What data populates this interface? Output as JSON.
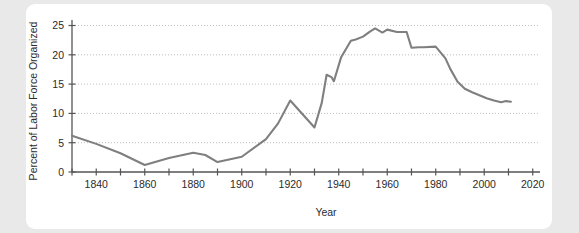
{
  "card": {
    "background_color": "#ffffff",
    "page_background_color": "#e9e9e9"
  },
  "chart_data": {
    "type": "line",
    "title": "",
    "xlabel": "Year",
    "ylabel": "Percent of Labor Force Organized",
    "xlim": [
      1830,
      2023
    ],
    "ylim": [
      0,
      25.6
    ],
    "grid": true,
    "grid_style": "dotted-horizontal",
    "legend": "none",
    "line_color": "#7f7f7f",
    "axis_color": "#555555",
    "grid_color": "#bdbdbd",
    "x_ticks_major": [
      1840,
      1860,
      1880,
      1900,
      1920,
      1940,
      1960,
      1980,
      2000,
      2020
    ],
    "x_tick_labels": [
      "1840",
      "1860",
      "1880",
      "1900",
      "1920",
      "1940",
      "1960",
      "1980",
      "2000",
      "2020"
    ],
    "x_ticks_minor": [
      1830,
      1850,
      1870,
      1890,
      1910,
      1930,
      1950,
      1970,
      1990,
      2010
    ],
    "y_ticks": [
      0,
      5,
      10,
      15,
      20,
      25
    ],
    "y_tick_labels": [
      "0",
      "5",
      "10",
      "15",
      "20",
      "25"
    ],
    "series": [
      {
        "name": "Percent of Labor Force Organized",
        "x": [
          1830,
          1840,
          1850,
          1860,
          1870,
          1880,
          1885,
          1890,
          1900,
          1910,
          1915,
          1920,
          1925,
          1930,
          1933,
          1935,
          1937,
          1938,
          1941,
          1945,
          1947,
          1950,
          1953,
          1955,
          1958,
          1960,
          1964,
          1968,
          1970,
          1973,
          1975,
          1980,
          1984,
          1986,
          1989,
          1992,
          1995,
          1998,
          2001,
          2004,
          2007,
          2009,
          2011
        ],
        "y": [
          6.2,
          4.8,
          3.2,
          1.2,
          2.4,
          3.3,
          2.9,
          1.7,
          2.6,
          5.6,
          8.3,
          12.2,
          9.9,
          7.6,
          11.8,
          16.6,
          16.2,
          15.5,
          19.6,
          22.4,
          22.6,
          23.1,
          24.0,
          24.5,
          23.8,
          24.3,
          23.9,
          23.9,
          21.2,
          21.3,
          21.3,
          21.4,
          19.4,
          17.6,
          15.4,
          14.2,
          13.6,
          13.1,
          12.6,
          12.2,
          11.9,
          12.1,
          12.0
        ]
      }
    ]
  },
  "axis_labels": {
    "x_title": "Year",
    "y_title": "Percent of Labor Force Organized"
  }
}
